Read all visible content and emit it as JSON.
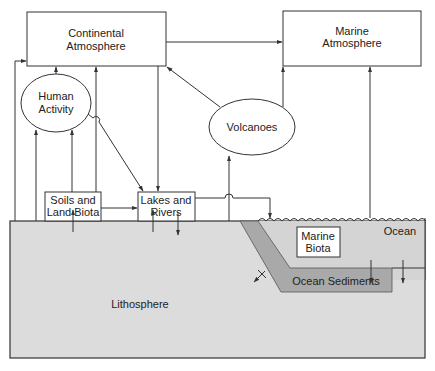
{
  "diagram": {
    "type": "box-and-arrow flow diagram",
    "colors": {
      "line": "#333333",
      "box_fill": "#ffffff",
      "lithosphere_fill": "#dcdcdc",
      "ocean_fill": "#d7d7d7",
      "sediment_fill": "#a9a9a9",
      "text": "#222222"
    },
    "nodes": {
      "continental_atmosphere": {
        "line1": "Continental",
        "line2": "Atmosphere"
      },
      "marine_atmosphere": {
        "line1": "Marine",
        "line2": "Atmosphere"
      },
      "human_activity": {
        "line1": "Human",
        "line2": "Activity"
      },
      "volcanoes": {
        "label": "Volcanoes"
      },
      "soils_land_biota": {
        "line1": "Soils and",
        "line2": "Land Biota"
      },
      "lakes_rivers": {
        "line1": "Lakes and",
        "line2": "Rivers"
      },
      "marine_biota": {
        "line1": "Marine",
        "line2": "Biota"
      },
      "ocean": {
        "label": "Ocean"
      },
      "ocean_sediments": {
        "label": "Ocean Sediments"
      },
      "lithosphere": {
        "label": "Lithosphere"
      }
    },
    "edges": [
      {
        "from": "Continental Atmosphere",
        "to": "Marine Atmosphere"
      },
      {
        "from": "Lithosphere",
        "to": "Continental Atmosphere"
      },
      {
        "from": "Human Activity",
        "to": "Continental Atmosphere"
      },
      {
        "from": "Soils and Land Biota",
        "to": "Continental Atmosphere"
      },
      {
        "from": "Continental Atmosphere",
        "to": "Lakes and Rivers"
      },
      {
        "from": "Volcanoes",
        "to": "Continental Atmosphere"
      },
      {
        "from": "Volcanoes",
        "to": "Marine Atmosphere"
      },
      {
        "from": "Ocean",
        "to": "Marine Atmosphere"
      },
      {
        "from": "Lithosphere",
        "to": "Human Activity"
      },
      {
        "from": "Soils and Land Biota",
        "to": "Human Activity"
      },
      {
        "from": "Human Activity",
        "to": "Lakes and Rivers"
      },
      {
        "from": "Soils and Land Biota",
        "to": "Lakes and Rivers"
      },
      {
        "from": "Lakes and Rivers",
        "to": "Ocean"
      },
      {
        "from": "Lithosphere",
        "to": "Volcanoes"
      },
      {
        "from": "Lithosphere",
        "to": "Soils and Land Biota"
      },
      {
        "from": "Lithosphere",
        "to": "Lakes and Rivers"
      },
      {
        "from": "Lakes and Rivers",
        "to": "Lithosphere"
      },
      {
        "from": "Ocean",
        "to": "Ocean Sediments"
      },
      {
        "from": "Ocean",
        "to": "Lithosphere"
      },
      {
        "from": "Ocean Sediments",
        "to": "Lithosphere"
      }
    ]
  }
}
